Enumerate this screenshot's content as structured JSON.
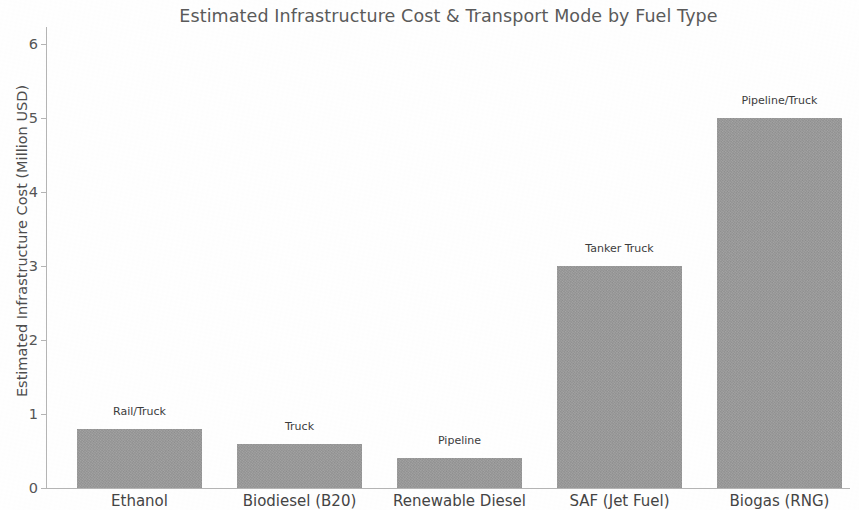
{
  "chart_data": {
    "type": "bar",
    "title": "Estimated Infrastructure Cost & Transport Mode by Fuel Type",
    "xlabel": "",
    "ylabel": "Estimated Infrastructure Cost (Million USD)",
    "categories": [
      "Ethanol",
      "Biodiesel (B20)",
      "Renewable Diesel",
      "SAF (Jet Fuel)",
      "Biogas (RNG)"
    ],
    "values": [
      0.8,
      0.6,
      0.4,
      3.0,
      5.0
    ],
    "annotations": [
      "Rail/Truck",
      "Truck",
      "Pipeline",
      "Tanker Truck",
      "Pipeline/Truck"
    ],
    "ylim": [
      0,
      6
    ],
    "yticks": [
      0,
      1,
      2,
      3,
      4,
      5,
      6
    ],
    "ytick_labels": [
      "0",
      "1",
      "2",
      "3",
      "4",
      "5",
      "6"
    ],
    "grid": false,
    "legend": null,
    "bar_color": "#a2a2a2",
    "title_color": "#5a5a5a",
    "axis_color": "#b4b4b4",
    "tick_label_color": "#555555"
  }
}
